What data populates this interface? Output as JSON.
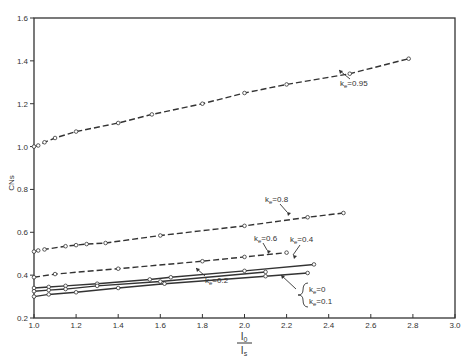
{
  "chart_data": {
    "type": "line",
    "title": "",
    "xlabel": "I0 / Is",
    "xlabel_num": "I",
    "xlabel_num_sub": "0",
    "xlabel_den": "I",
    "xlabel_den_sub": "s",
    "ylabel": "CNs",
    "xlim": [
      1.0,
      3.0
    ],
    "ylim": [
      0.2,
      1.6
    ],
    "xticks": [
      "1.0",
      "1.2",
      "1.4",
      "1.6",
      "1.8",
      "2.0",
      "2.2",
      "2.4",
      "2.6",
      "2.8",
      "3.0"
    ],
    "yticks": [
      "0.2",
      "0.4",
      "0.6",
      "0.8",
      "1.0",
      "1.2",
      "1.4",
      "1.6"
    ],
    "grid": false,
    "series": [
      {
        "name": "ke = 0.95",
        "label_main": "k",
        "label_sub": "e",
        "label_val": "=0.95",
        "style": "dashed",
        "x": [
          1.0,
          1.02,
          1.05,
          1.1,
          1.2,
          1.4,
          1.56,
          1.8,
          2.0,
          2.2,
          2.5,
          2.78
        ],
        "y": [
          1.0,
          1.005,
          1.02,
          1.04,
          1.07,
          1.11,
          1.15,
          1.2,
          1.25,
          1.29,
          1.34,
          1.41
        ]
      },
      {
        "name": "ke = 0.8",
        "label_main": "k",
        "label_sub": "e",
        "label_val": "=0.8",
        "style": "dashed",
        "x": [
          1.0,
          1.02,
          1.05,
          1.15,
          1.2,
          1.25,
          1.34,
          1.6,
          2.0,
          2.3,
          2.47
        ],
        "y": [
          0.51,
          0.515,
          0.52,
          0.535,
          0.54,
          0.545,
          0.55,
          0.585,
          0.63,
          0.67,
          0.69
        ]
      },
      {
        "name": "ke = 0.6",
        "label_main": "k",
        "label_sub": "e",
        "label_val": "=0.6",
        "style": "dashed",
        "x": [
          1.0,
          1.1,
          1.4,
          1.8,
          2.0,
          2.2
        ],
        "y": [
          0.39,
          0.405,
          0.43,
          0.465,
          0.485,
          0.505
        ]
      },
      {
        "name": "ke = 0.4",
        "label_main": "k",
        "label_sub": "e",
        "label_val": "=0.4",
        "style": "solid",
        "x": [
          1.0,
          1.07,
          1.15,
          1.3,
          1.55,
          1.65,
          2.0,
          2.33
        ],
        "y": [
          0.34,
          0.345,
          0.35,
          0.36,
          0.38,
          0.39,
          0.42,
          0.45
        ]
      },
      {
        "name": "ke = 0.2",
        "label_main": "k",
        "label_sub": "e",
        "label_val": "=0.2",
        "style": "solid",
        "x": [
          1.0,
          1.07,
          1.15,
          1.3,
          1.6,
          2.1
        ],
        "y": [
          0.325,
          0.33,
          0.335,
          0.35,
          0.37,
          0.415
        ]
      },
      {
        "name": "ke = 0 / ke = 0.1",
        "label_main": "k",
        "label_sub": "e",
        "label_val": "=0",
        "label_val2": "=0.1",
        "style": "solid",
        "x": [
          1.0,
          1.07,
          1.2,
          1.4,
          1.62,
          2.1,
          2.3
        ],
        "y": [
          0.3,
          0.31,
          0.32,
          0.34,
          0.36,
          0.395,
          0.41
        ]
      }
    ]
  }
}
